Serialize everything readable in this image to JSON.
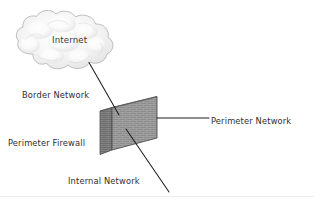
{
  "diagram": {
    "type": "network-diagram",
    "background_color": "#ffffff",
    "text_color": "#2e2e2e",
    "nodes": [
      {
        "id": "internet-cloud",
        "label": "Internet",
        "shape": "cloud",
        "fill_color": "#efefef",
        "stroke_color": "#b7b7b7"
      },
      {
        "id": "perimeter-firewall",
        "label": "Perimeter Firewall",
        "shape": "brick-wall",
        "fill_color": "#8a8a8a",
        "stroke_color": "#555555",
        "side_face_color": "#6f6f6f"
      }
    ],
    "labels": {
      "internet": "Internet",
      "border_network": "Border Network",
      "perimeter_firewall": "Perimeter Firewall",
      "perimeter_network": "Perimeter Network",
      "internal_network": "Internal Network"
    },
    "connectors": [
      {
        "id": "border-network-line",
        "label": "Border Network",
        "from": "internet-cloud",
        "to": "perimeter-firewall",
        "style": "solid",
        "color": "#222222"
      },
      {
        "id": "perimeter-network-line",
        "label": "Perimeter Network",
        "from": "perimeter-firewall",
        "to": "perimeter-network-label",
        "style": "solid",
        "color": "#222222"
      },
      {
        "id": "internal-network-line",
        "label": "Internal Network",
        "from": "perimeter-firewall",
        "to": "internal-network-label",
        "style": "solid",
        "color": "#222222"
      }
    ]
  }
}
